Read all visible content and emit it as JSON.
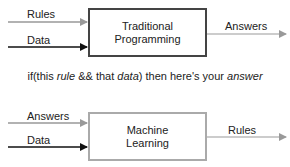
{
  "traditional": {
    "inputs": [
      "Rules",
      "Data"
    ],
    "box_line1": "Traditional",
    "box_line2": "Programming",
    "output": "Answers"
  },
  "caption": {
    "p1": "if(this ",
    "rule": "rule",
    "p2": " && that ",
    "data": "data",
    "p3": ") then here's your ",
    "answer": "answer"
  },
  "ml": {
    "inputs": [
      "Answers",
      "Data"
    ],
    "box_line1": "Machine",
    "box_line2": "Learning",
    "output": "Rules"
  },
  "colors": {
    "gray_arrow": "#999999",
    "dark_arrow": "#111111",
    "box1_border": "#444444",
    "box2_border": "#aaaaaa"
  }
}
